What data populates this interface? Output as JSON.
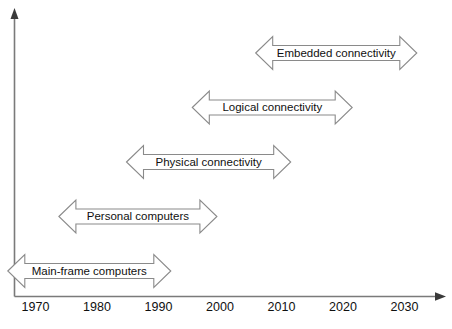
{
  "chart_data": {
    "type": "timeline",
    "title": "",
    "xlabel": "",
    "ylabel": "",
    "xlim": [
      1966,
      2035
    ],
    "grid": false,
    "legend": "none",
    "x_ticks": [
      1970,
      1980,
      1990,
      2000,
      2010,
      2020,
      2030
    ],
    "x_tick_labels": [
      "1970",
      "1980",
      "1990",
      "2000",
      "2010",
      "2020",
      "2030"
    ],
    "marker_style": "double-headed-arrow-banner",
    "series": [
      {
        "name": "Main-frame computers",
        "start": 1965.5,
        "end": 1992.0,
        "row": 0
      },
      {
        "name": "Personal computers",
        "start": 1973.8,
        "end": 1999.5,
        "row": 1
      },
      {
        "name": "Physical connectivity",
        "start": 1984.8,
        "end": 2011.5,
        "row": 2
      },
      {
        "name": "Logical connectivity",
        "start": 1995.5,
        "end": 2021.5,
        "row": 3
      },
      {
        "name": "Embedded connectivity",
        "start": 2005.8,
        "end": 2032.0,
        "row": 4
      }
    ]
  },
  "axes": {
    "vertical_axis_name": "vertical-axis",
    "horizontal_axis_name": "time-axis"
  },
  "colors": {
    "background": "#ffffff",
    "axis": "#7a7a7a",
    "banner_stroke": "#8a8a8a",
    "banner_fill": "#ffffff",
    "text": "#101010"
  }
}
